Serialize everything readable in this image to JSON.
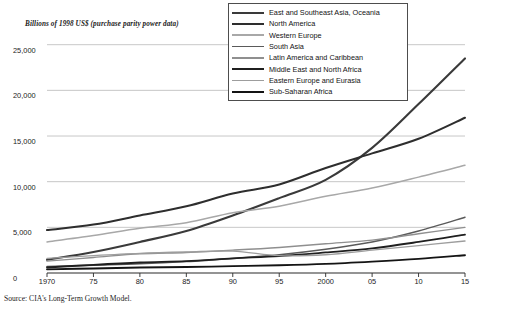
{
  "chart_data": {
    "type": "line",
    "title": "",
    "subtitle": "",
    "ylabel": "Billions of 1998 US$ (purchase parity power data)",
    "xlabel": "",
    "ylim": [
      0,
      26500
    ],
    "xlim": [
      1970,
      2015
    ],
    "grid": true,
    "legend_position": "top-right",
    "y_ticks": [
      "25,000",
      "20,000",
      "15,000",
      "10,000",
      "5,000",
      "0"
    ],
    "y_tick_values": [
      25000,
      20000,
      15000,
      10000,
      5000,
      0
    ],
    "x_ticks": [
      "1970",
      "75",
      "80",
      "85",
      "90",
      "95",
      "2000",
      "05",
      "10",
      "15"
    ],
    "x_tick_values": [
      1970,
      1975,
      1980,
      1985,
      1990,
      1995,
      2000,
      2005,
      2010,
      2015
    ],
    "x": [
      1970,
      1975,
      1980,
      1985,
      1990,
      1995,
      2000,
      2005,
      2010,
      2015
    ],
    "series": [
      {
        "name": "East and Southeast Asia, Oceania",
        "color": "#3a3a3a",
        "width": 2.1,
        "values": [
          1450,
          2300,
          3400,
          4600,
          6300,
          8200,
          10200,
          13700,
          18500,
          23500
        ]
      },
      {
        "name": "North America",
        "color": "#2e2e2e",
        "width": 2.0,
        "values": [
          4700,
          5300,
          6300,
          7300,
          8700,
          9700,
          11500,
          13100,
          14700,
          17000
        ]
      },
      {
        "name": "Western Europe",
        "color": "#a8a8a8",
        "width": 1.5,
        "values": [
          3400,
          4100,
          4900,
          5500,
          6600,
          7300,
          8400,
          9300,
          10500,
          11800
        ]
      },
      {
        "name": "South Asia",
        "color": "#5a5a5a",
        "width": 1.5,
        "values": [
          700,
          850,
          1000,
          1250,
          1600,
          2000,
          2600,
          3400,
          4600,
          6100
        ]
      },
      {
        "name": "Latin America and Caribbean",
        "color": "#8f8f8f",
        "width": 1.4,
        "values": [
          1300,
          1700,
          2100,
          2250,
          2500,
          2800,
          3200,
          3600,
          4300,
          5000
        ]
      },
      {
        "name": "Middle East and North Africa",
        "color": "#1f1f1f",
        "width": 1.8,
        "values": [
          600,
          900,
          1150,
          1300,
          1600,
          1850,
          2250,
          2700,
          3400,
          4200
        ]
      },
      {
        "name": "Eastern Europe and Eurasia",
        "color": "#9d9d9d",
        "width": 1.4,
        "values": [
          1600,
          1900,
          2150,
          2300,
          2400,
          1900,
          2000,
          2500,
          3000,
          3500
        ]
      },
      {
        "name": "Sub-Saharan Africa",
        "color": "#141414",
        "width": 1.9,
        "values": [
          400,
          500,
          600,
          650,
          750,
          850,
          1000,
          1250,
          1550,
          1950
        ]
      }
    ]
  },
  "legend": {
    "items": [
      "East and Southeast Asia, Oceania",
      "North America",
      "Western Europe",
      "South Asia",
      "Latin America and Caribbean",
      "Middle East and North Africa",
      "Eastern Europe and Eurasia",
      "Sub-Saharan Africa"
    ]
  },
  "source": {
    "note": "Source: CIA's Long-Term Growth Model."
  }
}
